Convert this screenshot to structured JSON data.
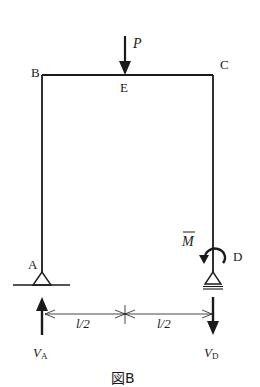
{
  "diagram": {
    "type": "structural-frame",
    "caption": "図B",
    "nodes": {
      "A": {
        "label": "A",
        "support": "pin"
      },
      "B": {
        "label": "B"
      },
      "C": {
        "label": "C"
      },
      "D": {
        "label": "D",
        "support": "roller"
      },
      "E": {
        "label": "E"
      }
    },
    "members": [
      {
        "from": "A",
        "to": "B"
      },
      {
        "from": "B",
        "to": "C"
      },
      {
        "from": "C",
        "to": "D"
      }
    ],
    "loads": {
      "point_load": {
        "label": "P",
        "at": "E",
        "direction": "down"
      },
      "moment": {
        "label": "M",
        "overbar": true,
        "at": "D",
        "direction": "counterclockwise"
      }
    },
    "reactions": {
      "VA": {
        "main": "V",
        "sub": "A",
        "direction": "up"
      },
      "VD": {
        "main": "V",
        "sub": "D",
        "direction": "down"
      }
    },
    "dimensions": [
      {
        "label": "l/2",
        "from": "A",
        "to": "midspan"
      },
      {
        "label": "l/2",
        "from": "midspan",
        "to": "D"
      }
    ]
  },
  "colors": {
    "ink": "#1a1a1a",
    "background": "#ffffff"
  }
}
